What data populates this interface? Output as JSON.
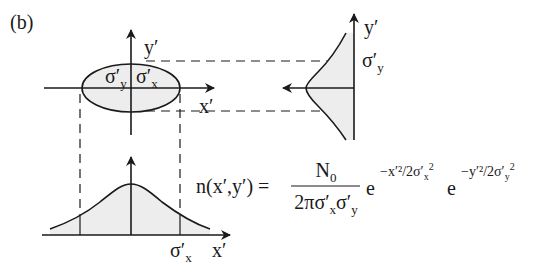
{
  "panel_label": "(b)",
  "ellipse": {
    "axis_x_label": "x′",
    "axis_y_label": "y′",
    "sigma_y_label": "σ′",
    "sigma_y_sub": "y",
    "sigma_x_label": "σ′",
    "sigma_x_sub": "x"
  },
  "side_profile": {
    "axis_y_label": "y′",
    "sigma_label": "σ′",
    "sigma_sub": "y"
  },
  "bottom_profile": {
    "axis_x_label": "x′",
    "sigma_label": "σ′",
    "sigma_sub": "x"
  },
  "equation": {
    "lhs": "n(x′,y′) =",
    "numerator": "N",
    "numerator_sub": "0",
    "denominator": "2πσ′",
    "denominator_sub1": "x",
    "denominator_mid": "σ′",
    "denominator_sub2": "y",
    "exp1_base": "e",
    "exp1_power": "−x′²/2σ′",
    "exp1_power_sub": "x",
    "exp1_power_sup": "2",
    "exp2_base": "e",
    "exp2_power": "−y′²/2σ′",
    "exp2_power_sub": "y",
    "exp2_power_sup": "2"
  },
  "colors": {
    "stroke": "#1a1a1a",
    "fill": "#ededed",
    "background": "#ffffff"
  }
}
